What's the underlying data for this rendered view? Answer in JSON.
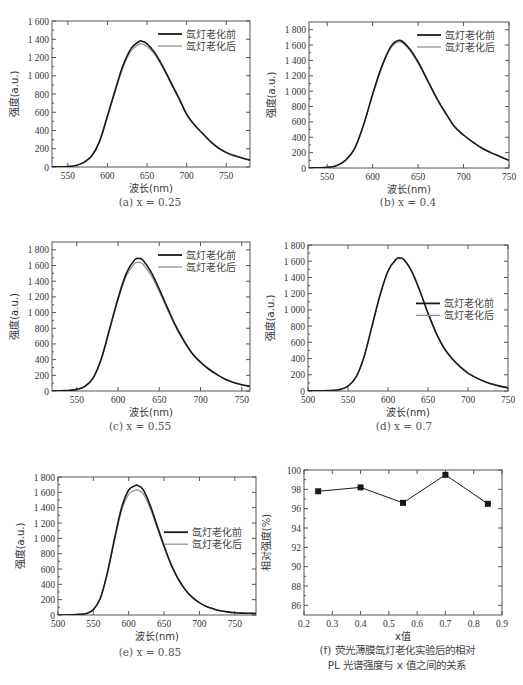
{
  "colors": {
    "before": "#1a1a1a",
    "after": "#8a8a8a",
    "frame": "#555555",
    "marker": "#1a1a1a"
  },
  "legend": {
    "before": "氙灯老化前",
    "after": "氙灯老化后"
  },
  "axis": {
    "xlabel": "波长(nm)",
    "ylabel": "强度(a.u.)"
  },
  "chart_data": [
    {
      "id": "a",
      "type": "line",
      "caption": "(a) x = 0.25",
      "xlabel": "波长(nm)",
      "ylabel": "强度(a.u.)",
      "xlim": [
        530,
        780
      ],
      "ylim": [
        0,
        1600
      ],
      "xticks": [
        550,
        600,
        650,
        700,
        750
      ],
      "yticks": [
        0,
        200,
        400,
        600,
        800,
        1000,
        1200,
        1400,
        1600
      ],
      "ytick_labels": [
        "0",
        "200",
        "400",
        "600",
        "800",
        "1 000",
        "1 200",
        "1 400",
        "1 600"
      ],
      "legend_pos": "top-right",
      "peak_x": 643,
      "series": [
        {
          "name": "氙灯老化前",
          "peak": 1380,
          "x": [
            530,
            550,
            560,
            570,
            580,
            590,
            600,
            610,
            620,
            630,
            640,
            643,
            650,
            660,
            670,
            680,
            690,
            700,
            710,
            720,
            730,
            740,
            750,
            760,
            770,
            780
          ],
          "values": [
            0,
            5,
            15,
            50,
            120,
            280,
            560,
            850,
            1120,
            1300,
            1375,
            1380,
            1350,
            1250,
            1100,
            930,
            760,
            580,
            460,
            370,
            280,
            210,
            160,
            125,
            100,
            75
          ]
        },
        {
          "name": "氙灯老化后",
          "peak": 1350,
          "x": [
            530,
            550,
            560,
            570,
            580,
            590,
            600,
            610,
            620,
            630,
            640,
            643,
            650,
            660,
            670,
            680,
            690,
            700,
            710,
            720,
            730,
            740,
            750,
            760,
            770,
            780
          ],
          "values": [
            0,
            5,
            14,
            48,
            115,
            270,
            545,
            830,
            1095,
            1275,
            1345,
            1350,
            1320,
            1230,
            1085,
            915,
            750,
            570,
            455,
            365,
            275,
            205,
            155,
            122,
            98,
            73
          ]
        }
      ]
    },
    {
      "id": "b",
      "type": "line",
      "caption": "(b) x = 0.4",
      "xlabel": "波长(nm)",
      "ylabel": "强度(a.u.)",
      "xlim": [
        530,
        750
      ],
      "ylim": [
        0,
        1900
      ],
      "xticks": [
        550,
        600,
        650,
        700,
        750
      ],
      "yticks": [
        0,
        200,
        400,
        600,
        800,
        1000,
        1200,
        1400,
        1600,
        1800
      ],
      "ytick_labels": [
        "0",
        "200",
        "400",
        "600",
        "800",
        "1 000",
        "1 200",
        "1 400",
        "1 600",
        "1 800"
      ],
      "legend_pos": "top-right",
      "peak_x": 630,
      "series": [
        {
          "name": "氙灯老化前",
          "peak": 1660,
          "x": [
            530,
            550,
            560,
            570,
            580,
            590,
            600,
            610,
            620,
            630,
            640,
            650,
            660,
            670,
            680,
            690,
            700,
            710,
            720,
            730,
            740,
            750
          ],
          "values": [
            0,
            8,
            30,
            100,
            250,
            560,
            960,
            1320,
            1580,
            1660,
            1560,
            1380,
            1150,
            920,
            720,
            540,
            430,
            340,
            260,
            200,
            150,
            100
          ]
        },
        {
          "name": "氙灯老化后",
          "peak": 1640,
          "x": [
            530,
            550,
            560,
            570,
            580,
            590,
            600,
            610,
            620,
            630,
            640,
            650,
            660,
            670,
            680,
            690,
            700,
            710,
            720,
            730,
            740,
            750
          ],
          "values": [
            0,
            8,
            30,
            98,
            245,
            550,
            950,
            1305,
            1560,
            1640,
            1545,
            1365,
            1140,
            910,
            712,
            535,
            425,
            336,
            257,
            198,
            148,
            98
          ]
        }
      ]
    },
    {
      "id": "c",
      "type": "line",
      "caption": "(c) x = 0.55",
      "xlabel": "波长(nm)",
      "ylabel": "强度(a.u.)",
      "xlim": [
        520,
        760
      ],
      "ylim": [
        0,
        1900
      ],
      "xticks": [
        550,
        600,
        650,
        700,
        750
      ],
      "yticks": [
        0,
        200,
        400,
        600,
        800,
        1000,
        1200,
        1400,
        1600,
        1800
      ],
      "ytick_labels": [
        "0",
        "200",
        "400",
        "600",
        "800",
        "1 000",
        "1 200",
        "1 400",
        "1 600",
        "1 800"
      ],
      "legend_pos": "top-right",
      "peak_x": 625,
      "series": [
        {
          "name": "氙灯老化前",
          "peak": 1690,
          "x": [
            520,
            540,
            550,
            560,
            570,
            580,
            590,
            600,
            610,
            620,
            625,
            630,
            640,
            650,
            660,
            670,
            680,
            690,
            700,
            710,
            720,
            730,
            740,
            750,
            760
          ],
          "values": [
            0,
            8,
            20,
            60,
            170,
            420,
            800,
            1180,
            1500,
            1670,
            1690,
            1670,
            1520,
            1300,
            1060,
            830,
            640,
            480,
            370,
            280,
            210,
            150,
            110,
            80,
            60
          ]
        },
        {
          "name": "氙灯老化后",
          "peak": 1640,
          "x": [
            520,
            540,
            550,
            560,
            570,
            580,
            590,
            600,
            610,
            620,
            625,
            630,
            640,
            650,
            660,
            670,
            680,
            690,
            700,
            710,
            720,
            730,
            740,
            750,
            760
          ],
          "values": [
            0,
            8,
            20,
            58,
            165,
            410,
            785,
            1160,
            1465,
            1625,
            1640,
            1620,
            1475,
            1265,
            1035,
            810,
            625,
            470,
            362,
            274,
            205,
            147,
            108,
            78,
            58
          ]
        }
      ]
    },
    {
      "id": "d",
      "type": "line",
      "caption": "(d) x = 0.7",
      "xlabel": "波长(nm)",
      "ylabel": "强度(a.u.)",
      "xlim": [
        500,
        750
      ],
      "ylim": [
        0,
        1800
      ],
      "xticks": [
        500,
        550,
        600,
        650,
        700,
        750
      ],
      "yticks": [
        0,
        200,
        400,
        600,
        800,
        1000,
        1200,
        1400,
        1600,
        1800
      ],
      "ytick_labels": [
        "0",
        "200",
        "400",
        "600",
        "800",
        "1 000",
        "1 200",
        "1 400",
        "1 600",
        "1 800"
      ],
      "legend_pos": "middle-right",
      "peak_x": 615,
      "series": [
        {
          "name": "氙灯老化前",
          "peak": 1640,
          "x": [
            500,
            520,
            530,
            540,
            550,
            560,
            570,
            580,
            590,
            600,
            610,
            615,
            620,
            630,
            640,
            650,
            660,
            670,
            680,
            690,
            700,
            710,
            720,
            730,
            740,
            750
          ],
          "values": [
            0,
            3,
            8,
            20,
            60,
            170,
            420,
            800,
            1180,
            1480,
            1625,
            1640,
            1620,
            1470,
            1230,
            960,
            720,
            530,
            400,
            300,
            220,
            165,
            120,
            85,
            60,
            40
          ]
        },
        {
          "name": "氙灯老化后",
          "peak": 1630,
          "x": [
            500,
            520,
            530,
            540,
            550,
            560,
            570,
            580,
            590,
            600,
            610,
            615,
            620,
            630,
            640,
            650,
            660,
            670,
            680,
            690,
            700,
            710,
            720,
            730,
            740,
            750
          ],
          "values": [
            0,
            3,
            8,
            20,
            60,
            170,
            418,
            797,
            1175,
            1475,
            1618,
            1630,
            1612,
            1465,
            1226,
            957,
            718,
            528,
            398,
            299,
            219,
            164,
            119,
            84,
            59,
            39
          ]
        }
      ]
    },
    {
      "id": "e",
      "type": "line",
      "caption": "(e) x = 0.85",
      "xlabel": "波长(nm)",
      "ylabel": "强度(a.u.)",
      "xlim": [
        500,
        780
      ],
      "ylim": [
        0,
        1800
      ],
      "xticks": [
        500,
        550,
        600,
        650,
        700,
        750
      ],
      "yticks": [
        0,
        200,
        400,
        600,
        800,
        1000,
        1200,
        1400,
        1600,
        1800
      ],
      "ytick_labels": [
        "0",
        "200",
        "400",
        "600",
        "800",
        "1 000",
        "1 200",
        "1 400",
        "1 600",
        "1 800"
      ],
      "legend_pos": "middle-right",
      "peak_x": 612,
      "series": [
        {
          "name": "氙灯老化前",
          "peak": 1690,
          "x": [
            500,
            520,
            530,
            540,
            550,
            560,
            570,
            580,
            590,
            600,
            610,
            612,
            620,
            630,
            640,
            650,
            660,
            670,
            680,
            690,
            700,
            710,
            720,
            730,
            740,
            750,
            760,
            770,
            780
          ],
          "values": [
            0,
            3,
            8,
            20,
            70,
            220,
            560,
            1000,
            1400,
            1630,
            1690,
            1690,
            1640,
            1440,
            1170,
            900,
            660,
            470,
            330,
            230,
            160,
            110,
            80,
            55,
            40,
            30,
            25,
            22,
            20
          ]
        },
        {
          "name": "氙灯老化后",
          "peak": 1630,
          "x": [
            500,
            520,
            530,
            540,
            550,
            560,
            570,
            580,
            590,
            600,
            610,
            612,
            620,
            630,
            640,
            650,
            660,
            670,
            680,
            690,
            700,
            710,
            720,
            730,
            740,
            750,
            760,
            770,
            780
          ],
          "values": [
            0,
            3,
            8,
            20,
            70,
            215,
            545,
            975,
            1360,
            1575,
            1630,
            1630,
            1585,
            1400,
            1140,
            880,
            648,
            463,
            326,
            228,
            159,
            110,
            80,
            55,
            40,
            30,
            25,
            22,
            20
          ]
        }
      ]
    },
    {
      "id": "f",
      "type": "line",
      "caption_line1": "(f) 荧光薄膜氙灯老化实验后的相对",
      "caption_line2": "PL 光谱强度与 x 值之间的关系",
      "xlabel": "x值",
      "ylabel": "相对强度(%)",
      "xlim": [
        0.2,
        0.9
      ],
      "ylim": [
        85,
        100
      ],
      "xticks": [
        0.2,
        0.3,
        0.4,
        0.5,
        0.6,
        0.7,
        0.8,
        0.9
      ],
      "xtick_labels": [
        "0.2",
        "0.3",
        "0.4",
        "0.5",
        "0.6",
        "0.7",
        "0.8",
        "0.9"
      ],
      "yticks": [
        86,
        88,
        90,
        92,
        94,
        96,
        98,
        100
      ],
      "ytick_labels": [
        "86",
        "88",
        "90",
        "92",
        "94",
        "96",
        "98",
        "100"
      ],
      "marker": "square",
      "series": [
        {
          "name": "相对强度",
          "x": [
            0.25,
            0.4,
            0.55,
            0.7,
            0.85
          ],
          "values": [
            97.8,
            98.2,
            96.6,
            99.5,
            96.5
          ]
        }
      ]
    }
  ],
  "figure_caption_partial": "图…（文字被截断）"
}
